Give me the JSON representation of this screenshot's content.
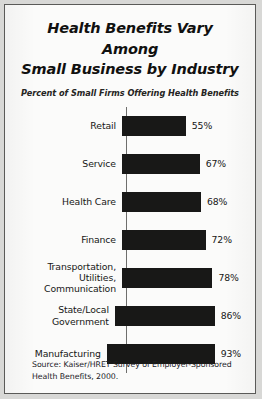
{
  "chart_data": {
    "type": "bar",
    "orientation": "horizontal",
    "title": "Health Benefits Vary Among Small Business by Industry",
    "title_lines": [
      "Health Benefits Vary Among",
      "Small Business by Industry"
    ],
    "subtitle": "Percent of Small Firms Offering Health Benefits",
    "xlabel": "",
    "ylabel": "",
    "xlim": [
      0,
      100
    ],
    "grid": false,
    "legend": "none",
    "categories": [
      "Retail",
      "Service",
      "Health Care",
      "Finance",
      "Transportation, Utilities, Communication",
      "State/Local Government",
      "Manufacturing"
    ],
    "values": [
      55,
      67,
      68,
      72,
      78,
      86,
      93
    ],
    "value_labels": [
      "55%",
      "67%",
      "68%",
      "72%",
      "78%",
      "86%",
      "93%"
    ],
    "bars": [
      {
        "label_lines": [
          "Retail"
        ],
        "value": 55,
        "value_label": "55%"
      },
      {
        "label_lines": [
          "Service"
        ],
        "value": 67,
        "value_label": "67%"
      },
      {
        "label_lines": [
          "Health Care"
        ],
        "value": 68,
        "value_label": "68%"
      },
      {
        "label_lines": [
          "Finance"
        ],
        "value": 72,
        "value_label": "72%"
      },
      {
        "label_lines": [
          "Transportation,",
          "Utilities,",
          "Communication"
        ],
        "value": 78,
        "value_label": "78%"
      },
      {
        "label_lines": [
          "State/Local",
          "Government"
        ],
        "value": 86,
        "value_label": "86%"
      },
      {
        "label_lines": [
          "Manufacturing"
        ],
        "value": 93,
        "value_label": "93%"
      }
    ],
    "bar_color": "#181817",
    "axis_color": "#6e6e6c"
  },
  "source": {
    "lines": [
      "Source: Kaiser/HRET Survey of Employer-Sponsored",
      "Health Benefits, 2000."
    ]
  },
  "colors": {
    "paper": "#fbfbfa",
    "frame": "#5a5a58",
    "page_margin": "#d8d8d6",
    "text": "#171716"
  }
}
